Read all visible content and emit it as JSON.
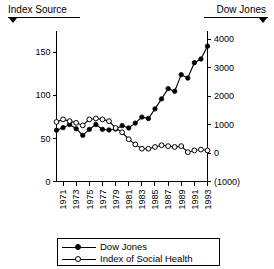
{
  "header": {
    "left_label": "Index Source",
    "left_arrow_icon": "triangle-down-icon",
    "right_label": "Dow Jones",
    "right_arrow_icon": "triangle-down-icon"
  },
  "legend": {
    "items": [
      {
        "label": "Dow Jones",
        "marker": "filled-circle",
        "color": "#000000"
      },
      {
        "label": "Index of Social Health",
        "marker": "open-circle",
        "color": "#000000"
      }
    ]
  },
  "chart_data": {
    "type": "line",
    "title": "",
    "subtitle": "",
    "xlabel": "",
    "ylabel": "",
    "y2label": "",
    "grid": false,
    "legend_position": "bottom",
    "xlim": [
      1970,
      1993
    ],
    "ylim": [
      0,
      175
    ],
    "y2lim": [
      -1000,
      4300
    ],
    "yticks": [
      0,
      50,
      100,
      150
    ],
    "yticklabels": [
      "0",
      "50",
      "100",
      "150"
    ],
    "y2ticks": [
      -1000,
      0,
      1000,
      2000,
      3000,
      4000
    ],
    "y2ticklabels": [
      "(1000)",
      "0",
      "1000",
      "2000",
      "3000",
      "4000"
    ],
    "xticks": [
      1971,
      1973,
      1975,
      1977,
      1979,
      1981,
      1983,
      1985,
      1987,
      1989,
      1991,
      1993
    ],
    "xticklabels": [
      "1971",
      "1973",
      "1975",
      "1977",
      "1979",
      "1981",
      "1983",
      "1985",
      "1987",
      "1989",
      "1991",
      "1993"
    ],
    "x": [
      1970,
      1971,
      1972,
      1973,
      1974,
      1975,
      1976,
      1977,
      1978,
      1979,
      1980,
      1981,
      1982,
      1983,
      1984,
      1985,
      1986,
      1987,
      1988,
      1989,
      1990,
      1991,
      1992,
      1993
    ],
    "series": [
      {
        "name": "Dow Jones",
        "axis": "right",
        "marker": "filled-circle",
        "values": [
          800,
          890,
          1000,
          850,
          620,
          830,
          1000,
          830,
          810,
          840,
          960,
          880,
          1050,
          1260,
          1210,
          1550,
          1900,
          2260,
          2170,
          2750,
          2630,
          3170,
          3300,
          3750
        ]
      },
      {
        "name": "Index of Social Health",
        "axis": "left",
        "marker": "open-circle",
        "values": [
          69,
          72,
          70,
          68,
          65,
          72,
          73,
          72,
          70,
          62,
          57,
          49,
          43,
          38,
          38,
          40,
          42,
          41,
          40,
          41,
          34,
          36,
          37,
          36
        ]
      }
    ]
  }
}
